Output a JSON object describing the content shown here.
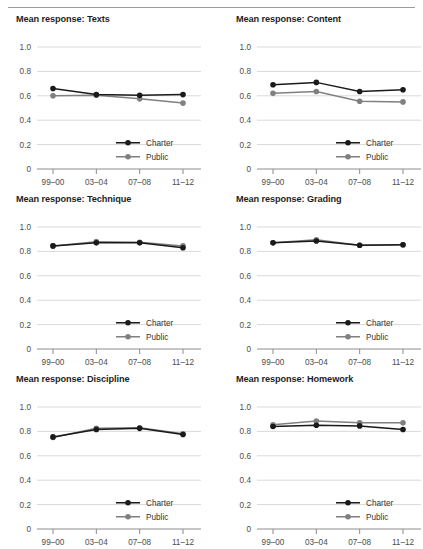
{
  "figure": {
    "name": "mean-response-small-multiples",
    "divider": "horizontal-rule"
  },
  "axis": {
    "y_ticks": [
      "1.0",
      "0.8",
      "0.6",
      "0.4",
      "0.2",
      "0"
    ],
    "y_values": [
      1.0,
      0.8,
      0.6,
      0.4,
      0.2,
      0
    ],
    "x_ticks": [
      "99–00",
      "03–04",
      "07–08",
      "11–12"
    ],
    "ylim": [
      0,
      1.0
    ]
  },
  "legend": {
    "charter_label": "Charter",
    "public_label": "Public",
    "charter_color": "#1a1a1a",
    "public_color": "#808080",
    "position": "inside-lower-right"
  },
  "chart_data": [
    {
      "type": "line",
      "title": "Mean response: Texts",
      "xlabel": "",
      "ylabel": "",
      "ylim": [
        0,
        1.0
      ],
      "grid": true,
      "categories": [
        "99–00",
        "03–04",
        "07–08",
        "11–12"
      ],
      "series": [
        {
          "name": "Charter",
          "values": [
            0.66,
            0.61,
            0.605,
            0.61
          ]
        },
        {
          "name": "Public",
          "values": [
            0.6,
            0.605,
            0.575,
            0.54
          ]
        }
      ]
    },
    {
      "type": "line",
      "title": "Mean response: Content",
      "xlabel": "",
      "ylabel": "",
      "ylim": [
        0,
        1.0
      ],
      "grid": true,
      "categories": [
        "99–00",
        "03–04",
        "07–08",
        "11–12"
      ],
      "series": [
        {
          "name": "Charter",
          "values": [
            0.69,
            0.71,
            0.635,
            0.65
          ]
        },
        {
          "name": "Public",
          "values": [
            0.62,
            0.635,
            0.555,
            0.55
          ]
        }
      ]
    },
    {
      "type": "line",
      "title": "Mean response: Technique",
      "xlabel": "",
      "ylabel": "",
      "ylim": [
        0,
        1.0
      ],
      "grid": true,
      "categories": [
        "99–00",
        "03–04",
        "07–08",
        "11–12"
      ],
      "series": [
        {
          "name": "Charter",
          "values": [
            0.845,
            0.87,
            0.87,
            0.83
          ]
        },
        {
          "name": "Public",
          "values": [
            0.845,
            0.88,
            0.875,
            0.845
          ]
        }
      ]
    },
    {
      "type": "line",
      "title": "Mean response: Grading",
      "xlabel": "",
      "ylabel": "",
      "ylim": [
        0,
        1.0
      ],
      "grid": true,
      "categories": [
        "99–00",
        "03–04",
        "07–08",
        "11–12"
      ],
      "series": [
        {
          "name": "Charter",
          "values": [
            0.87,
            0.885,
            0.85,
            0.855
          ]
        },
        {
          "name": "Public",
          "values": [
            0.87,
            0.895,
            0.85,
            0.855
          ]
        }
      ]
    },
    {
      "type": "line",
      "title": "Mean response: Discipline",
      "xlabel": "",
      "ylabel": "",
      "ylim": [
        0,
        1.0
      ],
      "grid": true,
      "categories": [
        "99–00",
        "03–04",
        "07–08",
        "11–12"
      ],
      "series": [
        {
          "name": "Charter",
          "values": [
            0.755,
            0.815,
            0.825,
            0.775
          ]
        },
        {
          "name": "Public",
          "values": [
            0.75,
            0.825,
            0.83,
            0.78
          ]
        }
      ]
    },
    {
      "type": "line",
      "title": "Mean response: Homework",
      "xlabel": "",
      "ylabel": "",
      "ylim": [
        0,
        1.0
      ],
      "grid": true,
      "categories": [
        "99–00",
        "03–04",
        "07–08",
        "11–12"
      ],
      "series": [
        {
          "name": "Charter",
          "values": [
            0.84,
            0.85,
            0.845,
            0.815
          ]
        },
        {
          "name": "Public",
          "values": [
            0.855,
            0.885,
            0.87,
            0.87
          ]
        }
      ]
    }
  ]
}
